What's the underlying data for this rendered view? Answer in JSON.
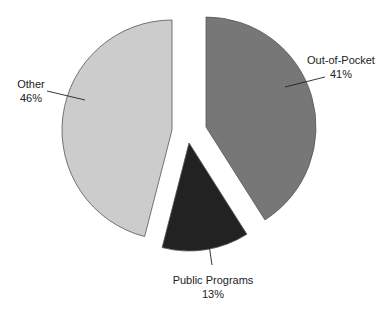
{
  "chart_data": {
    "type": "pie",
    "title": "",
    "exploded": true,
    "start_angle_deg": 0,
    "direction": "clockwise",
    "legend": "none",
    "slices": [
      {
        "name": "Out-of-Pocket",
        "value": 41,
        "label": "Out-of-Pocket",
        "pct_label": "41%",
        "color": "#777777",
        "center": [
          206,
          127
        ],
        "radius": 110,
        "label_pos": [
          341,
          64
        ],
        "leader": [
          [
            285,
            87
          ],
          [
            325,
            77
          ]
        ]
      },
      {
        "name": "Public Programs",
        "value": 13,
        "label": "Public Programs",
        "pct_label": "13%",
        "color": "#222222",
        "center": [
          189,
          143
        ],
        "radius": 108,
        "label_pos": [
          213,
          284
        ],
        "leader": [
          [
            208,
            238
          ],
          [
            212,
            265
          ]
        ]
      },
      {
        "name": "Other",
        "value": 46,
        "label": "Other",
        "pct_label": "46%",
        "color": "#cccccc",
        "center": [
          172,
          130
        ],
        "radius": 110,
        "label_pos": [
          31,
          88
        ],
        "leader": [
          [
            47,
            91
          ],
          [
            85,
            100
          ]
        ]
      }
    ]
  }
}
